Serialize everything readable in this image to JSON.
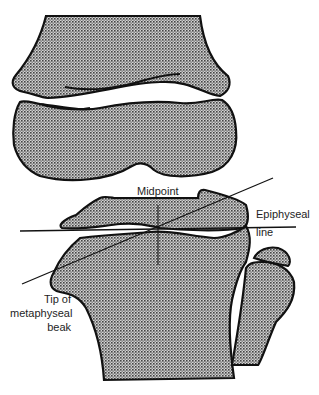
{
  "figure": {
    "colors": {
      "bone_fill": "#9a9a9a",
      "outline": "#111111",
      "background": "#ffffff",
      "text": "#1e1e1e"
    }
  },
  "labels": {
    "midpoint": "Midpoint",
    "epiphyseal_line_1": "Epiphyseal",
    "epiphyseal_line_2": "line",
    "tip_1": "Tip of",
    "tip_2": "metaphyseal",
    "tip_3": "beak"
  }
}
